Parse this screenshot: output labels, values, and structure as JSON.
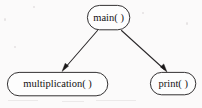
{
  "figure": {
    "background_color": "#fbfafa",
    "node_fill": "#fdfdfd",
    "node_stroke": "#1d1b1c",
    "edge_color": "#2a2729",
    "text_color": "#131112",
    "width": 202,
    "height": 108
  },
  "nodes": [
    {
      "id": "main",
      "label": "main( )",
      "shape": "rounded-rectangle",
      "x": 87,
      "y": 5,
      "width": 43,
      "height": 25,
      "center_x": 108.5,
      "center_y": 17.5,
      "font_size": 10.5
    },
    {
      "id": "multiplication",
      "label": "multiplication( )",
      "shape": "rounded-rectangle",
      "x": 7,
      "y": 72,
      "width": 101,
      "height": 24,
      "center_x": 57.5,
      "center_y": 84,
      "font_size": 10.5
    },
    {
      "id": "print",
      "label": "print( )",
      "shape": "rounded-rectangle",
      "x": 150,
      "y": 72,
      "width": 46,
      "height": 23,
      "center_x": 173,
      "center_y": 83.5,
      "font_size": 10.5
    }
  ],
  "edges": [
    {
      "id": "main-to-multiplication",
      "from": "main",
      "to": "multiplication",
      "arrowhead": "filled-triangle",
      "x1": 97,
      "y1": 30,
      "x2": 63,
      "y2": 70
    },
    {
      "id": "main-to-print",
      "from": "main",
      "to": "print",
      "arrowhead": "filled-triangle",
      "x1": 122,
      "y1": 30,
      "x2": 166,
      "y2": 71
    }
  ]
}
